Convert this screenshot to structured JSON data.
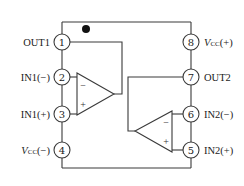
{
  "diagram": {
    "orientation_mark": "pin-1-dot",
    "pins": [
      {
        "number": "1",
        "label": "OUT1",
        "side": "left"
      },
      {
        "number": "2",
        "label": "IN1(−)",
        "side": "left"
      },
      {
        "number": "3",
        "label": "IN1(+)",
        "side": "left"
      },
      {
        "number": "4",
        "label_main": "V",
        "label_sub": "CC",
        "label_suffix": "(−)",
        "side": "left"
      },
      {
        "number": "5",
        "label": "IN2(+)",
        "side": "right"
      },
      {
        "number": "6",
        "label": "IN2(−)",
        "side": "right"
      },
      {
        "number": "7",
        "label": "OUT2",
        "side": "right"
      },
      {
        "number": "8",
        "label_main": "V",
        "label_sub": "CC",
        "label_suffix": "(+)",
        "side": "right"
      }
    ],
    "opamps": [
      {
        "name": "opamp-1",
        "inverting_sign": "−",
        "noninverting_sign": "+"
      },
      {
        "name": "opamp-2",
        "inverting_sign": "−",
        "noninverting_sign": "+"
      }
    ]
  }
}
